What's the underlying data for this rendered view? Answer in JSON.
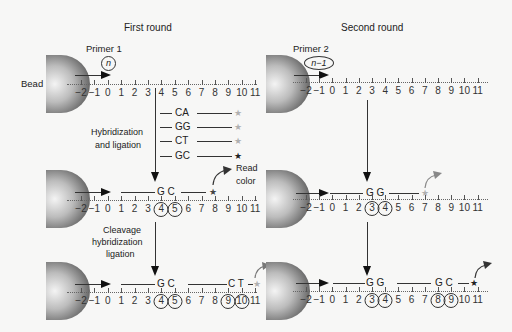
{
  "panels": {
    "first": {
      "title": "First round",
      "primer_label": "Primer 1",
      "primer_position": "n",
      "bead_label": "Bead",
      "axis_ticks": [
        "−2",
        "−1",
        "0",
        "1",
        "2",
        "3",
        "4",
        "5",
        "6",
        "7",
        "8",
        "9",
        "10",
        "11"
      ],
      "probes": [
        {
          "dinucleotide": "CA",
          "star_color": "#b0b0b0"
        },
        {
          "dinucleotide": "GG",
          "star_color": "#b0b0b0"
        },
        {
          "dinucleotide": "CT",
          "star_color": "#b0b0b0"
        },
        {
          "dinucleotide": "GC",
          "star_color": "#222222"
        }
      ],
      "step1_label_line1": "Hybridization",
      "step1_label_line2": "and ligation",
      "step2_label_line1": "Cleavage",
      "step2_label_line2": "hybridization",
      "step2_label_line3": "ligation",
      "read_label_line1": "Read",
      "read_label_line2": "color",
      "row2_bases": "G C",
      "row2_circled": [
        "4",
        "5"
      ],
      "row3_bases_a": "G C",
      "row3_bases_b": "C T",
      "row3_circled": [
        "4",
        "5",
        "9",
        "10"
      ]
    },
    "second": {
      "title": "Second round",
      "primer_label": "Primer 2",
      "primer_position": "n−1",
      "axis_ticks": [
        "−2",
        "−1",
        "0",
        "1",
        "2",
        "3",
        "4",
        "5",
        "6",
        "7",
        "8",
        "9",
        "10",
        "11"
      ],
      "row2_bases": "G G",
      "row2_circled": [
        "3",
        "4"
      ],
      "row3_bases_a": "G G",
      "row3_bases_b": "G C",
      "row3_circled": [
        "3",
        "4",
        "8",
        "9"
      ]
    }
  },
  "colors": {
    "line": "#333333",
    "arrow": "#111111",
    "star_gray": "#b0b0b0",
    "star_dark": "#222222",
    "background": "#f7f7f6"
  }
}
